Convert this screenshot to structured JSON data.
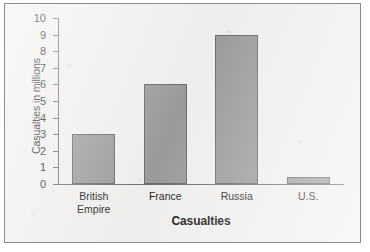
{
  "chart_data": {
    "type": "bar",
    "title": "",
    "xlabel": "Casualties",
    "ylabel": "Casualties in millions",
    "categories": [
      "British Empire",
      "France",
      "Russia",
      "U.S."
    ],
    "category_lines": [
      [
        "British",
        "Empire"
      ],
      [
        "France"
      ],
      [
        "Russia"
      ],
      [
        "U.S."
      ]
    ],
    "values": [
      3,
      6,
      9,
      0.4
    ],
    "ylim": [
      0,
      10
    ],
    "ytick_labels": [
      "0",
      "1",
      "2",
      "3",
      "4",
      "5",
      "6",
      "7",
      "8",
      "9",
      "10"
    ],
    "ytick_values": [
      0,
      1,
      2,
      3,
      4,
      5,
      6,
      7,
      8,
      9,
      10
    ],
    "grid": false,
    "legend": false,
    "bar_color": "#9b9b9b",
    "bar_border_color": "#6a6a6a",
    "axis_color": "#6e6e6e",
    "background_color": "#f1f0ee",
    "frame_color": "#8d8d8d"
  }
}
